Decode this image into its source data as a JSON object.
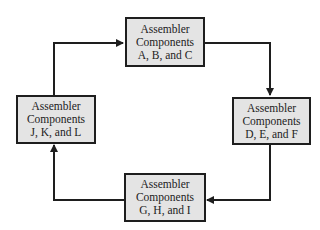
{
  "diagram": {
    "type": "cycle",
    "direction": "clockwise",
    "nodes": [
      {
        "id": "top",
        "line1": "Assembler",
        "line2": "Components",
        "line3": "A, B, and C"
      },
      {
        "id": "right",
        "line1": "Assembler",
        "line2": "Components",
        "line3": "D, E, and F"
      },
      {
        "id": "bottom",
        "line1": "Assembler",
        "line2": "Components",
        "line3": "G, H, and I"
      },
      {
        "id": "left",
        "line1": "Assembler",
        "line2": "Components",
        "line3": "J, K, and L"
      }
    ],
    "edges": [
      {
        "from": "top",
        "to": "right"
      },
      {
        "from": "right",
        "to": "bottom"
      },
      {
        "from": "bottom",
        "to": "left"
      },
      {
        "from": "left",
        "to": "top"
      }
    ],
    "colors": {
      "box_fill": "#e4e4e4",
      "line": "#1e1e1e"
    }
  }
}
